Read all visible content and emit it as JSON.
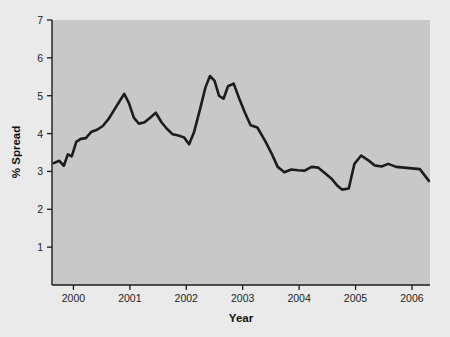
{
  "chart_data": {
    "type": "line",
    "title": "",
    "xlabel": "Year",
    "ylabel": "% Spread",
    "xlim": [
      1999.62,
      2006.32
    ],
    "ylim": [
      0,
      7
    ],
    "grid": false,
    "legend": null,
    "xticks": [
      2000,
      2001,
      2002,
      2003,
      2004,
      2005,
      2006
    ],
    "xtick_labels": [
      "2000",
      "2001",
      "2002",
      "2003",
      "2004",
      "2005",
      "2006"
    ],
    "yticks": [
      1,
      2,
      3,
      4,
      5,
      6,
      7
    ],
    "ytick_labels": [
      "1",
      "2",
      "3",
      "4",
      "5",
      "6",
      "7"
    ],
    "line_color": "#1c1c1c",
    "line_width": 2.6,
    "plot_bg_color": "#c8c8c8",
    "figure_bg_color": "#eaeaea",
    "series": [
      {
        "name": "% Spread",
        "x": [
          1999.65,
          1999.75,
          1999.83,
          1999.9,
          1999.97,
          2000.05,
          2000.13,
          2000.22,
          2000.32,
          2000.42,
          2000.52,
          2000.62,
          2000.72,
          2000.82,
          2000.9,
          2000.98,
          2001.07,
          2001.16,
          2001.26,
          2001.36,
          2001.46,
          2001.56,
          2001.66,
          2001.76,
          2001.86,
          2001.96,
          2002.05,
          2002.14,
          2002.24,
          2002.34,
          2002.42,
          2002.5,
          2002.58,
          2002.66,
          2002.74,
          2002.84,
          2002.94,
          2003.04,
          2003.14,
          2003.26,
          2003.4,
          2003.52,
          2003.62,
          2003.74,
          2003.86,
          2003.98,
          2004.1,
          2004.22,
          2004.34,
          2004.46,
          2004.58,
          2004.68,
          2004.76,
          2004.88,
          2004.98,
          2005.1,
          2005.22,
          2005.34,
          2005.46,
          2005.58,
          2005.72,
          2005.86,
          2006.0,
          2006.14,
          2006.3
        ],
        "y": [
          3.22,
          3.28,
          3.15,
          3.45,
          3.4,
          3.78,
          3.86,
          3.88,
          4.05,
          4.1,
          4.2,
          4.38,
          4.62,
          4.86,
          5.05,
          4.82,
          4.42,
          4.26,
          4.3,
          4.42,
          4.55,
          4.3,
          4.12,
          3.98,
          3.95,
          3.9,
          3.72,
          4.05,
          4.62,
          5.22,
          5.52,
          5.4,
          5.0,
          4.92,
          5.25,
          5.32,
          4.92,
          4.55,
          4.22,
          4.16,
          3.8,
          3.45,
          3.12,
          2.98,
          3.05,
          3.03,
          3.02,
          3.12,
          3.1,
          2.95,
          2.8,
          2.62,
          2.52,
          2.55,
          3.2,
          3.42,
          3.3,
          3.16,
          3.13,
          3.2,
          3.12,
          3.1,
          3.08,
          3.06,
          2.75
        ]
      }
    ]
  }
}
